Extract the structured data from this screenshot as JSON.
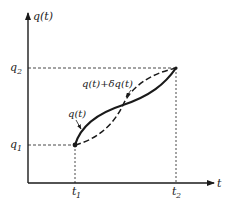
{
  "diagram": {
    "type": "variation-path-plot",
    "axes": {
      "y_label": "q(t)",
      "x_label": "t"
    },
    "ticks": {
      "q1": {
        "base": "q",
        "sub": "1"
      },
      "q2": {
        "base": "q",
        "sub": "2"
      },
      "t1": {
        "base": "t",
        "sub": "1"
      },
      "t2": {
        "base": "t",
        "sub": "2"
      }
    },
    "curves": [
      {
        "name": "q(t)",
        "style": "solid",
        "label": "q(t)"
      },
      {
        "name": "q(t)+δq(t)",
        "style": "dashed",
        "label": "q(t)+δq(t)"
      }
    ],
    "points": {
      "start": {
        "t": "t1",
        "q": "q1"
      },
      "end": {
        "t": "t2",
        "q": "q2"
      }
    },
    "colors": {
      "ink": "#1a1a1a",
      "background": "#ffffff"
    }
  }
}
